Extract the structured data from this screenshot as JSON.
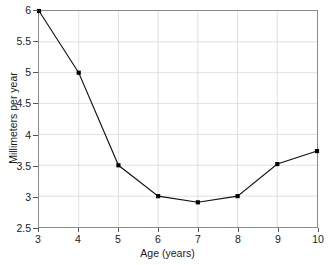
{
  "chart_data": {
    "type": "line",
    "title": "",
    "xlabel": "Age (years)",
    "ylabel": "Millimeters per year",
    "x": [
      3,
      4,
      5,
      6,
      7,
      8,
      9,
      10
    ],
    "values": [
      6.0,
      5.0,
      3.5,
      3.0,
      2.9,
      3.0,
      3.52,
      3.73
    ],
    "xlim": [
      3,
      10
    ],
    "ylim": [
      2.5,
      6
    ],
    "xticks": [
      3,
      4,
      5,
      6,
      7,
      8,
      9,
      10
    ],
    "xtick_labels": [
      "3",
      "4",
      "5",
      "6",
      "7",
      "8",
      "9",
      "10"
    ],
    "yticks": [
      2.5,
      3,
      3.5,
      4,
      4.5,
      5,
      5.5,
      6
    ],
    "ytick_labels": [
      "2.5",
      "3",
      "3.5",
      "4",
      "4.5",
      "5",
      "5.5",
      "6"
    ],
    "grid": true,
    "legend": null,
    "marker": "square",
    "line_color": "#111111",
    "marker_color": "#000000",
    "grid_color": "#d8d8d8",
    "axis_color": "#8a8a8a",
    "background": "#ffffff"
  }
}
